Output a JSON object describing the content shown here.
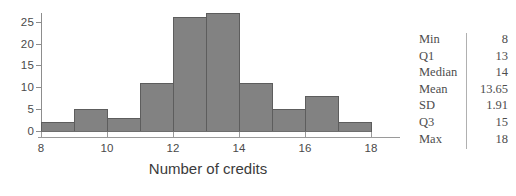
{
  "chart_data": {
    "type": "bar",
    "title": "",
    "xlabel": "Number of credits",
    "ylabel": "",
    "xlim": [
      8,
      18
    ],
    "ylim": [
      0,
      27
    ],
    "grid": false,
    "legend": "none",
    "bin_width": 1,
    "bin_edges": [
      8,
      9,
      10,
      11,
      12,
      13,
      14,
      15,
      16,
      17,
      18
    ],
    "categories": [
      "8-9",
      "9-10",
      "10-11",
      "11-12",
      "12-13",
      "13-14",
      "14-15",
      "15-16",
      "16-17",
      "17-18"
    ],
    "values": [
      2,
      5,
      3,
      11,
      26,
      27,
      11,
      5,
      8,
      2
    ],
    "x_ticks": [
      8,
      10,
      12,
      14,
      16,
      18
    ],
    "x_tick_labels": [
      "8",
      "10",
      "12",
      "14",
      "16",
      "18"
    ],
    "y_ticks": [
      0,
      5,
      10,
      15,
      20,
      25
    ],
    "y_tick_labels": [
      "0",
      "5",
      "10",
      "15",
      "20",
      "25"
    ],
    "bar_fill_color": "#828282",
    "bar_edge_color": "#5d5d5d",
    "axis_color": "#8d8d8d"
  },
  "stats": {
    "rows": [
      {
        "label": "Min",
        "value": "8"
      },
      {
        "label": "Q1",
        "value": "13"
      },
      {
        "label": "Median",
        "value": "14"
      },
      {
        "label": "Mean",
        "value": "13.65"
      },
      {
        "label": "SD",
        "value": "1.91"
      },
      {
        "label": "Q3",
        "value": "15"
      },
      {
        "label": "Max",
        "value": "18"
      }
    ]
  }
}
